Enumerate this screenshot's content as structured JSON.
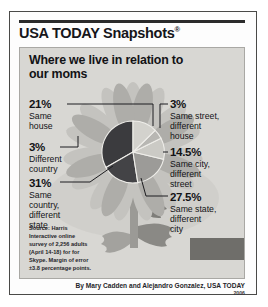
{
  "masthead": {
    "brand": "USA TODAY Snapshots",
    "registered_mark": "®"
  },
  "panel": {
    "title": "Where we live in relation to our moms"
  },
  "labels": {
    "same_house": {
      "pct": "21%",
      "desc": "Same\nhouse"
    },
    "diff_country": {
      "pct": "3%",
      "desc": "Different\ncountry"
    },
    "same_country": {
      "pct": "31%",
      "desc": "Same\ncountry,\ndifferent\nstate"
    },
    "same_street": {
      "pct": "3%",
      "desc": "Same street,\ndifferent\nhouse"
    },
    "same_city": {
      "pct": "14.5%",
      "desc": "Same city,\ndifferent\nstreet"
    },
    "same_state": {
      "pct": "27.5%",
      "desc": "Same state,\ndifferent\ncity"
    }
  },
  "source": "Source: Harris Interactive online survey of 2,256 adults (April 14-18) for for Skype. Margin of error ±3.8 percentage points.",
  "byline": {
    "credit": "By Mary Cadden and Alejandro Gonzalez, USA TODAY",
    "year": "2006"
  },
  "colors": {
    "panel_background": "#d8d7d3",
    "petal_light": "#c6c5c1",
    "petal_mid": "#b0afab",
    "stem_dark": "#8e8d89",
    "pie_dark": "#3b3b3e",
    "pie_mid": "#9a9a97",
    "pie_light": "#cfcec9",
    "text": "#131316",
    "border": "#4a4a48"
  },
  "chart_data": {
    "type": "pie",
    "title": "Where we live in relation to our moms",
    "categories": [
      "Same house",
      "Same street, different house",
      "Same city, different street",
      "Same state, different city",
      "Same country, different state",
      "Different country"
    ],
    "values": [
      21,
      3,
      14.5,
      27.5,
      31,
      3
    ],
    "unit": "percent",
    "legend": "callout labels",
    "annotations": [
      "21% Same house",
      "3% Same street, different house",
      "14.5% Same city, different street",
      "27.5% Same state, different city",
      "31% Same country, different state",
      "3% Different country"
    ]
  }
}
